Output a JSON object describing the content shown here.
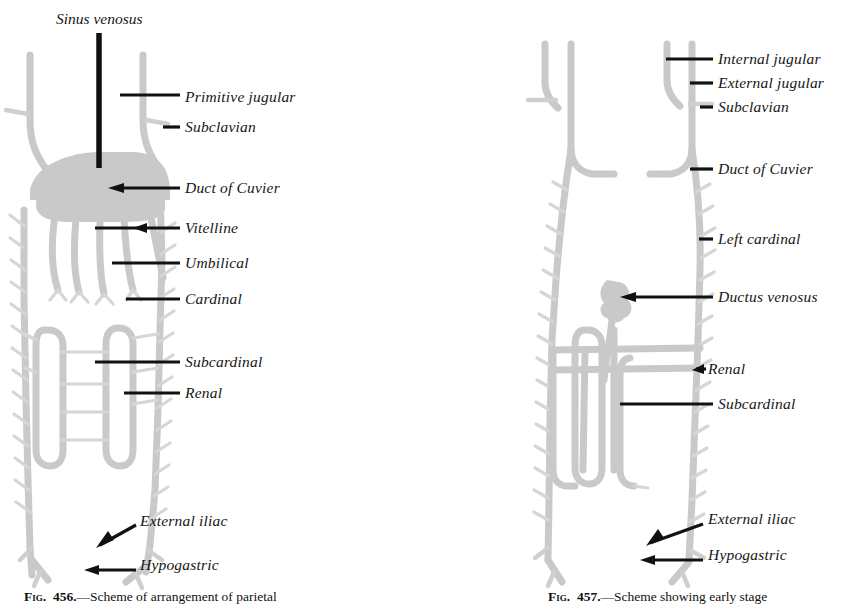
{
  "page": {
    "background_color": "#ffffff",
    "vessel_color": "#c9c9c9",
    "vessel_color_light": "#d8d8d8",
    "leader_color": "#111111",
    "text_color": "#161616"
  },
  "figures": [
    {
      "id": "fig-456",
      "number": "456",
      "caption_prefix": "Fig.",
      "caption_number": "456.",
      "caption_text": "—Scheme of arrangement of parietal",
      "caption_full": "Fig. 456.—Scheme of arrangement of parietal",
      "title_label": "Sinus venosus",
      "labels": [
        {
          "key": "primitive-jugular",
          "text": "Primitive jugular",
          "x": 185,
          "y": 88
        },
        {
          "key": "subclavian",
          "text": "Subclavian",
          "x": 185,
          "y": 118
        },
        {
          "key": "duct-of-cuvier",
          "text": "Duct of Cuvier",
          "x": 185,
          "y": 181
        },
        {
          "key": "vitelline",
          "text": "Vitelline",
          "x": 185,
          "y": 221
        },
        {
          "key": "umbilical",
          "text": "Umbilical",
          "x": 185,
          "y": 256
        },
        {
          "key": "cardinal",
          "text": "Cardinal",
          "x": 185,
          "y": 292
        },
        {
          "key": "subcardinal",
          "text": "Subcardinal",
          "x": 185,
          "y": 355
        },
        {
          "key": "renal",
          "text": "Renal",
          "x": 185,
          "y": 386
        },
        {
          "key": "external-iliac",
          "text": "External iliac",
          "x": 140,
          "y": 520
        },
        {
          "key": "hypogastric",
          "text": "Hypogastric",
          "x": 140,
          "y": 563
        }
      ]
    },
    {
      "id": "fig-457",
      "number": "457",
      "caption_prefix": "Fig.",
      "caption_number": "457.",
      "caption_text": "—Scheme showing early stage",
      "caption_full": "Fig. 457.—Scheme showing early stage",
      "labels": [
        {
          "key": "internal-jugular",
          "text": "Internal jugular",
          "x": 718,
          "y": 52
        },
        {
          "key": "external-jugular",
          "text": "External jugular",
          "x": 718,
          "y": 76
        },
        {
          "key": "subclavian",
          "text": "Subclavian",
          "x": 718,
          "y": 100
        },
        {
          "key": "duct-of-cuvier",
          "text": "Duct of Cuvier",
          "x": 718,
          "y": 162
        },
        {
          "key": "left-cardinal",
          "text": "Left cardinal",
          "x": 718,
          "y": 232
        },
        {
          "key": "ductus-venosus",
          "text": "Ductus venosus",
          "x": 718,
          "y": 290
        },
        {
          "key": "renal",
          "text": "Renal",
          "x": 708,
          "y": 362
        },
        {
          "key": "subcardinal",
          "text": "Subcardinal",
          "x": 718,
          "y": 397
        },
        {
          "key": "external-iliac",
          "text": "External iliac",
          "x": 708,
          "y": 518
        },
        {
          "key": "hypogastric",
          "text": "Hypogastric",
          "x": 708,
          "y": 553
        }
      ]
    }
  ]
}
